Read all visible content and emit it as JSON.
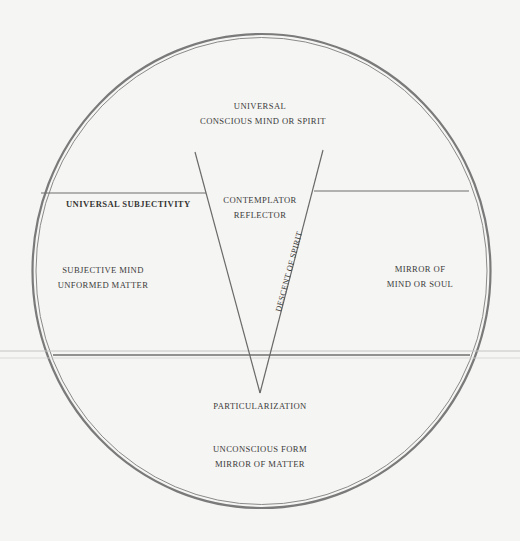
{
  "diagram": {
    "colors": {
      "background": "#f5f5f3",
      "line": "#6f6f6f",
      "circle": "#7a7a7a",
      "text": "#3a3a3a"
    },
    "labels": {
      "top": {
        "line1": "UNIVERSAL",
        "line2": "CONSCIOUS MIND OR SPIRIT"
      },
      "left_upper": "UNIVERSAL SUBJECTIVITY",
      "center_upper": {
        "line1": "CONTEMPLATOR",
        "line2": "REFLECTOR"
      },
      "left_middle": {
        "line1": "SUBJECTIVE MIND",
        "line2": "UNFORMED MATTER"
      },
      "right_middle": {
        "line1": "MIRROR OF",
        "line2": "MIND OR SOUL"
      },
      "v_arm": "DESCENT OF SPIRIT",
      "apex": "PARTICULARIZATION",
      "bottom": {
        "line1": "UNCONSCIOUS FORM",
        "line2": "MIRROR OF MATTER"
      }
    }
  }
}
